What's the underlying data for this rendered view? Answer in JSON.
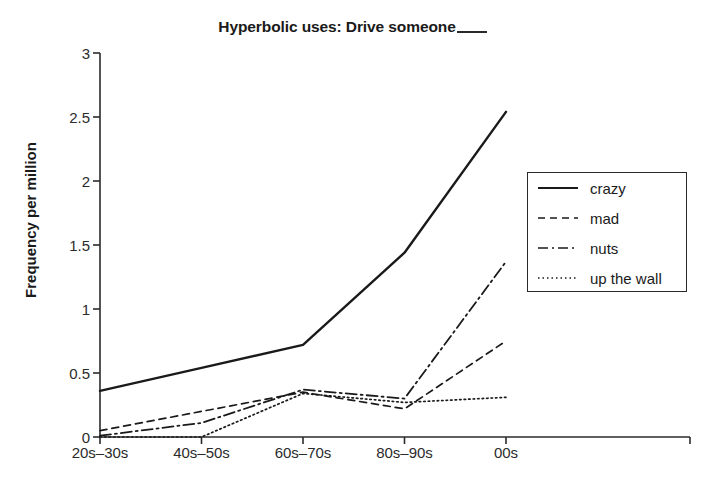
{
  "chart_data": {
    "type": "line",
    "title_main": "Hyperbolic uses: Drive someone",
    "xlabel": "",
    "ylabel": "Frequency per million",
    "categories": [
      "20s–30s",
      "40s–50s",
      "60s–70s",
      "80s–90s",
      "00s"
    ],
    "ylim": [
      0,
      3
    ],
    "yticks": [
      0,
      0.5,
      1,
      1.5,
      2,
      2.5,
      3
    ],
    "ytick_labels": [
      "0",
      "0.5",
      "1",
      "1.5",
      "2",
      "2.5",
      "3"
    ],
    "grid": false,
    "legend_position": "right",
    "series": [
      {
        "name": "crazy",
        "linestyle": "solid",
        "color": "#1a1a1a",
        "values": [
          0.36,
          0.54,
          0.72,
          1.44,
          2.54
        ]
      },
      {
        "name": "mad",
        "linestyle": "dashed",
        "color": "#1a1a1a",
        "values": [
          0.05,
          0.2,
          0.35,
          0.22,
          0.75
        ]
      },
      {
        "name": "nuts",
        "linestyle": "dashdot",
        "color": "#1a1a1a",
        "values": [
          0.01,
          0.11,
          0.37,
          0.3,
          1.37
        ]
      },
      {
        "name": "up the wall",
        "linestyle": "dotted",
        "color": "#1a1a1a",
        "values": [
          0.0,
          0.0,
          0.34,
          0.27,
          0.31
        ]
      }
    ]
  },
  "legend": {
    "entries": [
      {
        "label": "crazy",
        "style": "solid"
      },
      {
        "label": "mad",
        "style": "dashed"
      },
      {
        "label": "nuts",
        "style": "dashdot"
      },
      {
        "label": "up the wall",
        "style": "dotted"
      }
    ]
  },
  "colors": {
    "ink": "#1a1a1a",
    "axis": "#2b2b2b",
    "background": "#ffffff"
  }
}
